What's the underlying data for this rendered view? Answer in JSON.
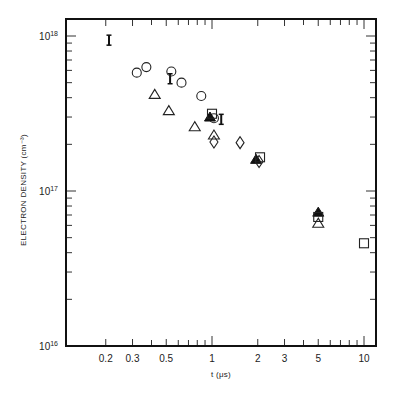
{
  "chart_data": {
    "type": "scatter",
    "title": "",
    "xlabel": "t (μs)",
    "ylabel": "ELECTRON DENSITY (cm⁻³)",
    "xscale": "log",
    "yscale": "log",
    "xlim": [
      0.1,
      11
    ],
    "ylim": [
      1e+16,
      1.3e+18
    ],
    "grid": false,
    "legend": "none",
    "x_ticks": [
      {
        "value": 0.2,
        "label": "0.2"
      },
      {
        "value": 0.3,
        "label": "0.3"
      },
      {
        "value": 0.5,
        "label": "0.5"
      },
      {
        "value": 1,
        "label": "1"
      },
      {
        "value": 2,
        "label": "2"
      },
      {
        "value": 3,
        "label": "3"
      },
      {
        "value": 5,
        "label": "5"
      },
      {
        "value": 10,
        "label": "10"
      }
    ],
    "y_ticks": [
      {
        "value": 1e+16,
        "base": "10",
        "exp": "16"
      },
      {
        "value": 1e+17,
        "base": "10",
        "exp": "17"
      },
      {
        "value": 1e+18,
        "base": "10",
        "exp": "18"
      }
    ],
    "series": [
      {
        "name": "error-bar",
        "marker": "I",
        "points": [
          [
            0.21,
            9.4e+17
          ],
          [
            0.53,
            5.3e+17
          ],
          [
            1.15,
            2.9e+17
          ]
        ]
      },
      {
        "name": "circle",
        "marker": "circle-open",
        "points": [
          [
            0.32,
            5.8e+17
          ],
          [
            0.37,
            6.3e+17
          ],
          [
            0.54,
            5.9e+17
          ],
          [
            0.63,
            5e+17
          ],
          [
            0.85,
            4.1e+17
          ],
          [
            1.03,
            2.95e+17
          ]
        ]
      },
      {
        "name": "triangle",
        "marker": "triangle-open",
        "points": [
          [
            0.42,
            4.2e+17
          ],
          [
            0.52,
            3.3e+17
          ],
          [
            0.77,
            2.6e+17
          ],
          [
            1.03,
            2.3e+17
          ],
          [
            5.0,
            6.2e+16
          ]
        ]
      },
      {
        "name": "filled-triangle",
        "marker": "triangle-filled",
        "points": [
          [
            0.97,
            3e+17
          ],
          [
            1.95,
            1.6e+17
          ],
          [
            5.0,
            7.3e+16
          ]
        ]
      },
      {
        "name": "square",
        "marker": "square-open",
        "points": [
          [
            1.0,
            3.15e+17
          ],
          [
            2.07,
            1.65e+17
          ],
          [
            5.0,
            6.8e+16
          ],
          [
            10.0,
            4.6e+16
          ]
        ]
      },
      {
        "name": "diamond",
        "marker": "diamond-open",
        "points": [
          [
            1.03,
            2.07e+17
          ],
          [
            1.53,
            2.05e+17
          ],
          [
            2.04,
            1.55e+17
          ]
        ]
      }
    ]
  },
  "layout": {
    "plot_left": 66,
    "plot_right": 376,
    "plot_top": 19,
    "plot_bottom": 346,
    "x_one_px": 212,
    "x_decade_px": 152,
    "y_e16_px": 346,
    "y_decade_px": 155
  }
}
